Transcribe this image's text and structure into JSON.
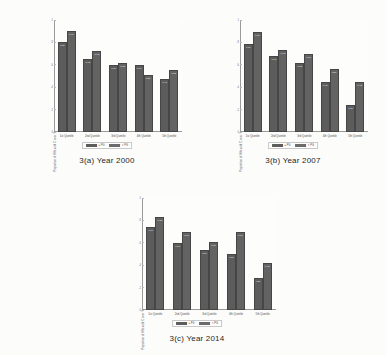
{
  "figure": {
    "background": "#fcfcfb",
    "bar_color_series1": "#5c5c5c",
    "bar_color_series2": "#636363"
  },
  "panels": [
    {
      "id": "panel-a",
      "caption": "3(a) Year 2000",
      "chart_data": {
        "type": "bar",
        "title": "",
        "xlabel": "",
        "ylabel": "Proportion of HHs with C over Y",
        "categories": [
          "1st Quintile",
          "2nd Quintile",
          "3rd Quintile",
          "4th Quintile",
          "5th Quintile"
        ],
        "ylim": [
          0,
          1
        ],
        "yticks": [
          "0",
          ".2",
          ".4",
          ".6",
          ".8",
          "1"
        ],
        "grid": false,
        "legend_position": "bottom",
        "series": [
          {
            "name": "≥ PG",
            "values": [
              0.8,
              0.65,
              0.6,
              0.6,
              0.47
            ],
            "labels": [
              "0.80",
              "0.65",
              "0.60",
              "0.60",
              "0.47"
            ]
          },
          {
            "name": "< PG",
            "values": [
              0.9,
              0.72,
              0.62,
              0.51,
              0.55
            ],
            "labels": [
              "0.90",
              "0.72",
              "0.62",
              "0.51",
              "0.55"
            ]
          }
        ]
      }
    },
    {
      "id": "panel-b",
      "caption": "3(b) Year 2007",
      "chart_data": {
        "type": "bar",
        "title": "",
        "xlabel": "",
        "ylabel": "Proportion of HHs with C over Y",
        "categories": [
          "1st Quintile",
          "2nd Quintile",
          "3rd Quintile",
          "4th Quintile",
          "5th Quintile"
        ],
        "ylim": [
          0,
          1
        ],
        "yticks": [
          "0",
          ".2",
          ".4",
          ".6",
          ".8",
          "1"
        ],
        "grid": false,
        "legend_position": "bottom",
        "series": [
          {
            "name": "≥ PG",
            "values": [
              0.79,
              0.68,
              0.62,
              0.45,
              0.24
            ],
            "labels": [
              "0.79",
              "0.68",
              "0.62",
              "0.45",
              "0.24"
            ]
          },
          {
            "name": "< PG",
            "values": [
              0.89,
              0.73,
              0.7,
              0.56,
              0.45
            ],
            "labels": [
              "0.89",
              "0.73",
              "0.70",
              "0.56",
              "0.45"
            ]
          }
        ]
      }
    },
    {
      "id": "panel-c",
      "caption": "3(c) Year 2014",
      "chart_data": {
        "type": "bar",
        "title": "",
        "xlabel": "",
        "ylabel": "Proportion of HHs with C over Y",
        "categories": [
          "1st Quintile",
          "2nd Quintile",
          "3rd Quintile",
          "4th Quintile",
          "5th Quintile"
        ],
        "ylim": [
          0,
          1
        ],
        "yticks": [
          "0",
          ".2",
          ".4",
          ".6",
          ".8",
          "1"
        ],
        "grid": false,
        "legend_position": "bottom",
        "series": [
          {
            "name": "≥ PG",
            "values": [
              0.74,
              0.6,
              0.54,
              0.5,
              0.29
            ],
            "labels": [
              "0.74",
              "0.60",
              "0.54",
              "0.50",
              "0.29"
            ]
          },
          {
            "name": "< PG",
            "values": [
              0.83,
              0.7,
              0.61,
              0.7,
              0.42
            ],
            "labels": [
              "0.83",
              "0.70",
              "0.61",
              "0.70",
              "0.42"
            ]
          }
        ]
      }
    }
  ]
}
